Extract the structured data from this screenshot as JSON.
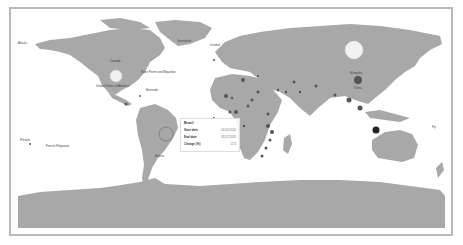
{
  "map": {
    "type": "world-bubble-map",
    "land_color": "#a8a8a8",
    "ocean_color": "#ffffff",
    "border_color": "#b9b9b9",
    "bubble_color": "#555555",
    "highlight_bubble_color": "#f2f2f2"
  },
  "labels": {
    "alaska": "Alaska",
    "canada": "Canada",
    "saint_pierre": "Saint Pierre and Miquelon",
    "united_states": "United States of America",
    "bermuda": "Bermuda",
    "greenland": "Greenland",
    "iceland": "Iceland",
    "mongolia": "Mongolia",
    "china": "China",
    "brazil_map": "Brazil",
    "bolivia": "Bolivia",
    "french_polynesia": "French Polynesia",
    "pitcairn": "Pitcairn",
    "fiji": "Fiji"
  },
  "tooltip": {
    "title": "Brazil",
    "rows": [
      {
        "key": "Start date",
        "value": "01/01/2020"
      },
      {
        "key": "End date",
        "value": "31/12/2020"
      },
      {
        "key": "Change (%)",
        "value": "12.3"
      }
    ]
  }
}
